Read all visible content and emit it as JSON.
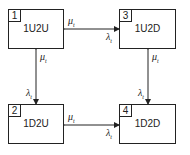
{
  "states": [
    {
      "id": "1",
      "label": "1U2U"
    },
    {
      "id": "2",
      "label": "1D2U"
    },
    {
      "id": "3",
      "label": "1U2D"
    },
    {
      "id": "4",
      "label": "1D2D"
    }
  ],
  "rates": {
    "top_mu": "μ",
    "top_mu_sub": "t",
    "top_lambda": "λ",
    "top_lambda_sub": "t",
    "left_mu": "μ",
    "left_mu_sub": "t",
    "left_lambda": "λ",
    "left_lambda_sub": "t",
    "right_mu": "μ",
    "right_mu_sub": "t",
    "right_lambda": "λ",
    "right_lambda_sub": "t",
    "bottom_mu": "μ",
    "bottom_mu_sub": "t",
    "bottom_lambda": "λ",
    "bottom_lambda_sub": "t"
  }
}
